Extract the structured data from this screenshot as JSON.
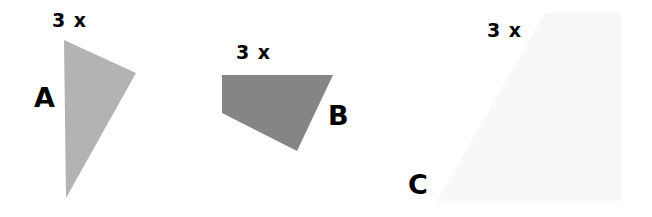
{
  "figure": {
    "shapes": [
      {
        "id": "A",
        "label": "A",
        "scale_label": "3 x",
        "type": "triangle",
        "fill": "#b3b3b3",
        "points": "64,40 136,73 66,198"
      },
      {
        "id": "B",
        "label": "B",
        "scale_label": "3 x",
        "type": "quadrilateral",
        "fill": "#858585",
        "points": "222,75 333,75 297,151 222,113"
      },
      {
        "id": "C",
        "label": "C",
        "scale_label": "3 x",
        "type": "trapezoid",
        "fill": "#f8f8f8",
        "points": "545,13 622,13 622,201 437,201"
      }
    ]
  }
}
